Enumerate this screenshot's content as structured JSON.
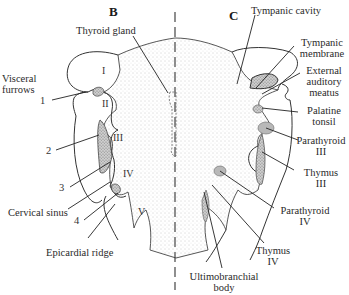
{
  "figure": {
    "panels": [
      {
        "id": "B",
        "label": "B"
      },
      {
        "id": "C",
        "label": "C"
      }
    ],
    "left_labels": {
      "visceral_furrows": [
        "Visceral",
        "furrows"
      ],
      "cervical_sinus": "Cervical sinus",
      "epicardial_ridge": "Epicardial ridge",
      "thyroid_gland": "Thyroid gland"
    },
    "furrow_numbers": [
      "1",
      "2",
      "3",
      "4"
    ],
    "arch_numerals": [
      "I",
      "II",
      "III",
      "IV",
      "V"
    ],
    "right_labels": {
      "tympanic_cavity": "Tympanic cavity",
      "tympanic_membrane": [
        "Tympanic",
        "membrane"
      ],
      "external_auditory_meatus": [
        "External",
        "auditory",
        "meatus"
      ],
      "palatine_tonsil": [
        "Palatine",
        "tonsil"
      ],
      "parathyroid_iii": [
        "Parathyroid",
        "III"
      ],
      "thymus_iii": [
        "Thymus",
        "III"
      ],
      "parathyroid_iv": [
        "Parathyroid",
        "IV"
      ],
      "thymus_iv": [
        "Thymus",
        "IV"
      ],
      "ultimobranchial_body": [
        "Ultimobranchial",
        "body"
      ]
    },
    "colors": {
      "outline": "#333333",
      "stipple": "#8a8a8a",
      "shade": "#6f6f6f",
      "text": "#2a2a2a"
    }
  }
}
